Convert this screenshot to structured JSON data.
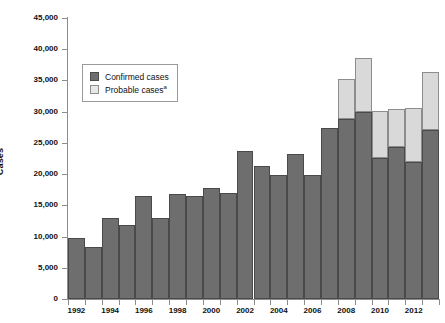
{
  "chart_data": {
    "type": "bar",
    "stacked": true,
    "title": "",
    "xlabel": "",
    "ylabel": "Cases",
    "ylim": [
      0,
      45000
    ],
    "ytick_step": 5000,
    "ytick_labels": [
      "0",
      "5,000",
      "10,000",
      "15,000",
      "20,000",
      "25,000",
      "30,000",
      "35,000",
      "40,000",
      "45,000"
    ],
    "ytick_values": [
      0,
      5000,
      10000,
      15000,
      20000,
      25000,
      30000,
      35000,
      40000,
      45000
    ],
    "grid": false,
    "legend_position": "upper-left-inside",
    "x": [
      1992,
      1993,
      1994,
      1995,
      1996,
      1997,
      1998,
      1999,
      2000,
      2001,
      2002,
      2003,
      2004,
      2005,
      2006,
      2007,
      2008,
      2009,
      2010,
      2011,
      2012,
      2013
    ],
    "xtick_labels": [
      "1992",
      "1994",
      "1996",
      "1998",
      "2000",
      "2002",
      "2004",
      "2006",
      "2008",
      "2010",
      "2012"
    ],
    "xtick_values": [
      1992,
      1994,
      1996,
      1998,
      2000,
      2002,
      2004,
      2006,
      2008,
      2010,
      2012
    ],
    "series": [
      {
        "name": "Confirmed cases",
        "color": "#6e6e6e",
        "edge": "#4a4a4a",
        "values": [
          9800,
          8300,
          13000,
          11800,
          16500,
          12900,
          16800,
          16500,
          17700,
          17000,
          23700,
          21300,
          19900,
          23300,
          19900,
          27400,
          28900,
          29900,
          22600,
          24300,
          22000,
          27100
        ]
      },
      {
        "name": "Probable cases",
        "color": "#d9d9d9",
        "edge": "#8d8d8d",
        "footnote": "a",
        "values": [
          0,
          0,
          0,
          0,
          0,
          0,
          0,
          0,
          0,
          0,
          0,
          0,
          0,
          0,
          0,
          0,
          6400,
          8700,
          7500,
          6100,
          8600,
          9200
        ]
      }
    ]
  },
  "legend": {
    "items": [
      {
        "label": "Confirmed cases",
        "footnote": ""
      },
      {
        "label": "Probable cases",
        "footnote": "a"
      }
    ]
  }
}
